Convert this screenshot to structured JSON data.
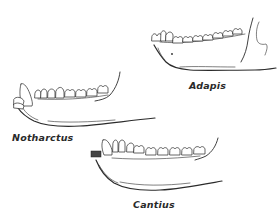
{
  "figure": {
    "specimens": [
      {
        "id": "adapis",
        "label": "Adapis"
      },
      {
        "id": "notharctus",
        "label": "Notharctus"
      },
      {
        "id": "cantius",
        "label": "Cantius"
      }
    ]
  },
  "colors": {
    "background": "#ffffff",
    "ink": "#2b2b2b"
  }
}
